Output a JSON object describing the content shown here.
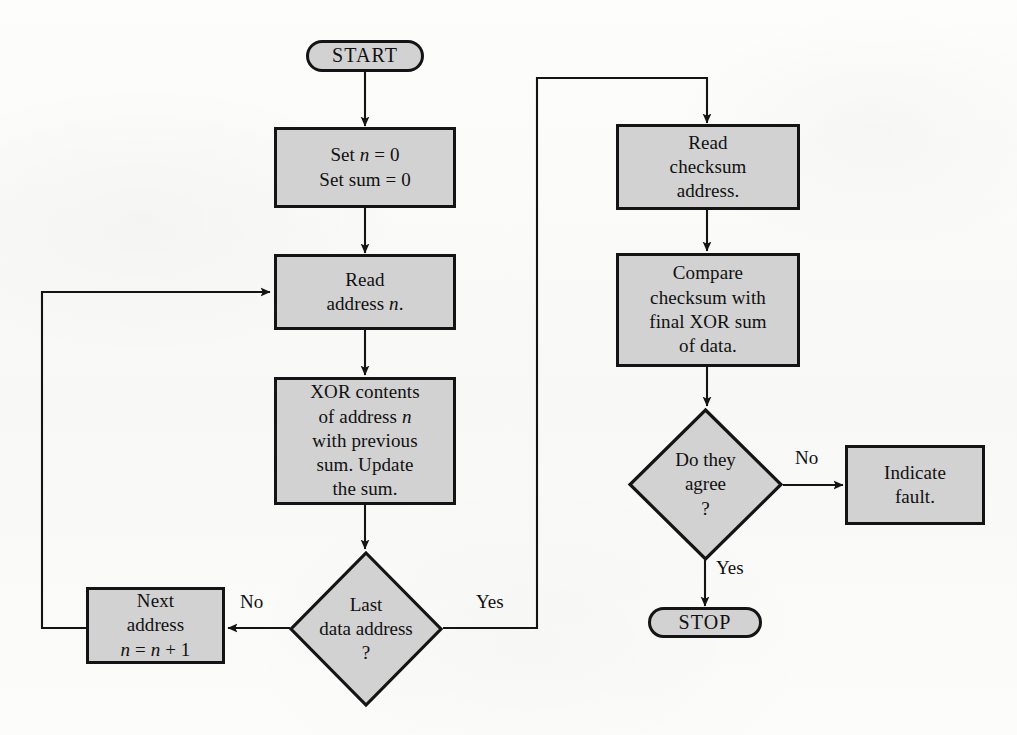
{
  "diagram": {
    "colors": {
      "node_fill": "#d2d2d2",
      "node_stroke": "#141414",
      "page_background": "#fbfbfa",
      "text": "#101010"
    },
    "nodes": {
      "start": {
        "label": "START",
        "shape": "terminal"
      },
      "init": {
        "line1": "Set n = 0",
        "line2": "Set sum = 0",
        "shape": "process"
      },
      "read_address": {
        "line1": "Read",
        "line2": "address n.",
        "shape": "process"
      },
      "xor": {
        "line1": "XOR contents",
        "line2": "of address n",
        "line3": "with previous",
        "line4": "sum. Update",
        "line5": "the sum.",
        "shape": "process"
      },
      "last_address": {
        "line1": "Last",
        "line2": "data address",
        "line3": "?",
        "shape": "decision"
      },
      "next_address": {
        "line1": "Next",
        "line2": "address",
        "line3": "n = n + 1",
        "shape": "process"
      },
      "read_checksum": {
        "line1": "Read",
        "line2": "checksum",
        "line3": "address.",
        "shape": "process"
      },
      "compare": {
        "line1": "Compare",
        "line2": "checksum with",
        "line3": "final XOR sum",
        "line4": "of data.",
        "shape": "process"
      },
      "do_they_agree": {
        "line1": "Do they",
        "line2": "agree",
        "line3": "?",
        "shape": "decision"
      },
      "indicate_fault": {
        "line1": "Indicate",
        "line2": "fault.",
        "shape": "process"
      },
      "stop": {
        "label": "STOP",
        "shape": "terminal"
      }
    },
    "edge_labels": {
      "last_address_no": "No",
      "last_address_yes": "Yes",
      "agree_no": "No",
      "agree_yes": "Yes"
    }
  }
}
